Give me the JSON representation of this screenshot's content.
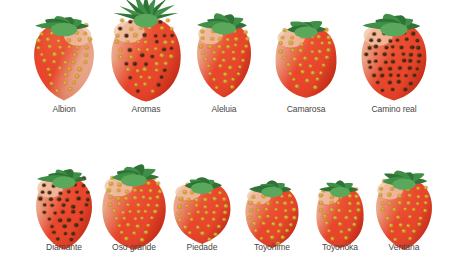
{
  "figure": {
    "name": "strawberry-cultivar-plate",
    "background_color": "#ffffff",
    "width": 452,
    "height": 266,
    "label_color": "#4a4744",
    "label_font_size": 9.5
  },
  "palette": {
    "flesh_red": "#e8432a",
    "flesh_red_dark": "#c62d18",
    "flesh_red_light": "#f4694a",
    "shoulder_pink": "#e8a98c",
    "shoulder_pale": "#f0c4a8",
    "seed_gold": "#c9a227",
    "seed_gold_light": "#e8c65a",
    "seed_dark": "#3a2410",
    "seed_dark_ring": "#7a4a20",
    "calyx_green": "#3f8f46",
    "calyx_green_dark": "#2f7336",
    "calyx_green_light": "#5aa85c",
    "outline": "#b8301a"
  },
  "rows": [
    {
      "name": "row-top",
      "y": 8,
      "label_y": 104,
      "items": [
        {
          "name": "albion",
          "label": "Albion",
          "cx": 64,
          "body_w": 62,
          "body_h": 78,
          "body_top": 22,
          "shape": "long-conic",
          "seed_style": "gold",
          "seed_rows": 11,
          "seed_cols": 6,
          "calyx": "broad-leaf",
          "calyx_w": 66,
          "calyx_h": 26,
          "calyx_top": 18,
          "shoulder": "right-pale",
          "label_x": 64
        },
        {
          "name": "aromas",
          "label": "Aromas",
          "cx": 146,
          "body_w": 70,
          "body_h": 84,
          "body_top": 18,
          "shape": "wide-conic",
          "seed_style": "gold-dark",
          "seed_rows": 12,
          "seed_cols": 7,
          "calyx": "spiky-star",
          "calyx_w": 72,
          "calyx_h": 34,
          "calyx_top": 4,
          "shoulder": "left-pale",
          "label_x": 146
        },
        {
          "name": "aleluia",
          "label": "Aleluia",
          "cx": 224,
          "body_w": 56,
          "body_h": 76,
          "body_top": 22,
          "shape": "long-conic",
          "seed_style": "gold",
          "seed_rows": 11,
          "seed_cols": 6,
          "calyx": "broad-leaf",
          "calyx_w": 60,
          "calyx_h": 24,
          "calyx_top": 18,
          "shoulder": "left-pale",
          "label_x": 224
        },
        {
          "name": "camarosa",
          "label": "Camarosa",
          "cx": 306,
          "body_w": 62,
          "body_h": 72,
          "body_top": 26,
          "shape": "blunt-conic",
          "seed_style": "gold",
          "seed_rows": 10,
          "seed_cols": 6,
          "calyx": "narrow-leaf",
          "calyx_w": 58,
          "calyx_h": 22,
          "calyx_top": 22,
          "shoulder": "left-pale",
          "label_x": 306
        },
        {
          "name": "camino-real",
          "label": "Camino real",
          "cx": 394,
          "body_w": 66,
          "body_h": 78,
          "body_top": 22,
          "shape": "heart-conic",
          "seed_style": "dark",
          "seed_rows": 11,
          "seed_cols": 7,
          "calyx": "broad-leaf",
          "calyx_w": 68,
          "calyx_h": 26,
          "calyx_top": 16,
          "shoulder": "left-pale",
          "label_x": 394
        }
      ]
    },
    {
      "name": "row-bottom",
      "y": 160,
      "label_y": 242,
      "items": [
        {
          "name": "diamante",
          "label": "Diamante",
          "cx": 64,
          "body_w": 58,
          "body_h": 74,
          "body_top": 176,
          "shape": "long-conic",
          "seed_style": "dark",
          "seed_rows": 11,
          "seed_cols": 6,
          "calyx": "broad-leaf",
          "calyx_w": 58,
          "calyx_h": 24,
          "calyx_top": 170,
          "shoulder": "left-pale",
          "label_x": 64
        },
        {
          "name": "oso-grande",
          "label": "Oso grande",
          "cx": 134,
          "body_w": 64,
          "body_h": 76,
          "body_top": 174,
          "shape": "wide-conic",
          "seed_style": "gold",
          "seed_rows": 11,
          "seed_cols": 7,
          "calyx": "broad-leaf",
          "calyx_w": 64,
          "calyx_h": 24,
          "calyx_top": 168,
          "shoulder": "left-pale",
          "label_x": 134
        },
        {
          "name": "piedade",
          "label": "Piedade",
          "cx": 202,
          "body_w": 58,
          "body_h": 62,
          "body_top": 182,
          "shape": "heart",
          "seed_style": "gold",
          "seed_rows": 9,
          "seed_cols": 6,
          "calyx": "narrow-leaf",
          "calyx_w": 56,
          "calyx_h": 22,
          "calyx_top": 176,
          "shoulder": "left-pale",
          "label_x": 202
        },
        {
          "name": "toyohime",
          "label": "Toyohime",
          "cx": 272,
          "body_w": 54,
          "body_h": 62,
          "body_top": 186,
          "shape": "heart",
          "seed_style": "gold",
          "seed_rows": 9,
          "seed_cols": 6,
          "calyx": "narrow-leaf",
          "calyx_w": 54,
          "calyx_h": 20,
          "calyx_top": 180,
          "shoulder": "left-pale",
          "label_x": 272
        },
        {
          "name": "toyonoka",
          "label": "Toyonoka",
          "cx": 340,
          "body_w": 48,
          "body_h": 62,
          "body_top": 186,
          "shape": "blunt-conic",
          "seed_style": "gold",
          "seed_rows": 9,
          "seed_cols": 5,
          "calyx": "narrow-leaf",
          "calyx_w": 50,
          "calyx_h": 20,
          "calyx_top": 180,
          "shoulder": "left-pale",
          "label_x": 340
        },
        {
          "name": "ventana",
          "label": "Ventana",
          "cx": 404,
          "body_w": 58,
          "body_h": 72,
          "body_top": 178,
          "shape": "long-conic",
          "seed_style": "gold",
          "seed_rows": 10,
          "seed_cols": 6,
          "calyx": "broad-leaf",
          "calyx_w": 58,
          "calyx_h": 22,
          "calyx_top": 172,
          "shoulder": "left-pale",
          "label_x": 404
        }
      ]
    }
  ]
}
